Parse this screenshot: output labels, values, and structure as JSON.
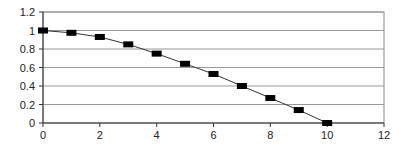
{
  "chart_data": {
    "type": "line",
    "title": "",
    "xlabel": "",
    "ylabel": "",
    "x": [
      0,
      1,
      2,
      3,
      4,
      5,
      6,
      7,
      8,
      9,
      10
    ],
    "series": [
      {
        "name": "Series 1",
        "values": [
          1.0,
          0.975,
          0.93,
          0.85,
          0.75,
          0.64,
          0.53,
          0.4,
          0.27,
          0.14,
          0.0
        ],
        "marker": "rectangle",
        "color": "#000000"
      }
    ],
    "xlim": [
      0,
      12
    ],
    "ylim": [
      0,
      1.2
    ],
    "xticks": [
      "0",
      "2",
      "4",
      "6",
      "8",
      "10",
      "12"
    ],
    "yticks": [
      "0",
      "0.2",
      "0.4",
      "0.6",
      "0.8",
      "1",
      "1.2"
    ],
    "grid": {
      "horizontal": true,
      "vertical": false
    },
    "legend": null
  }
}
